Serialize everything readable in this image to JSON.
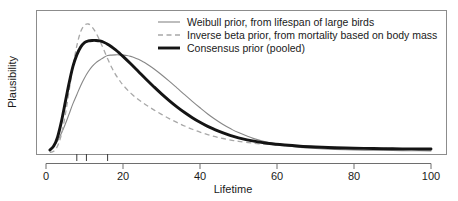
{
  "chart_data": {
    "type": "line",
    "title": "",
    "xlabel": "Lifetime",
    "ylabel": "Plausibility",
    "xlim": [
      0,
      104
    ],
    "ylim": [
      0,
      1.08
    ],
    "grid": false,
    "legend_position": "top-right-inside",
    "xticks": [
      0,
      20,
      40,
      60,
      80,
      100
    ],
    "xtick_labels": [
      "0",
      "20",
      "40",
      "60",
      "80",
      "100"
    ],
    "yticks": [],
    "ytick_labels": [],
    "rug_marks": [
      8,
      10.5,
      16
    ],
    "series": [
      {
        "name": "Weibull prior, from lifespan of large birds",
        "style": "solid-thin",
        "color": "#878787",
        "peak_x": 21,
        "peak_y": 0.76,
        "x": [
          1,
          2,
          3,
          4,
          5,
          6,
          7,
          8,
          9,
          10,
          11,
          12,
          13,
          14,
          15,
          16,
          17,
          18,
          19,
          20,
          21,
          22,
          23,
          24,
          25,
          26,
          28,
          30,
          32,
          34,
          36,
          38,
          40,
          42,
          44,
          46,
          48,
          50,
          54,
          58,
          62,
          66,
          70,
          75,
          80,
          85,
          90,
          95,
          100
        ],
        "y": [
          0.02,
          0.05,
          0.09,
          0.15,
          0.22,
          0.3,
          0.38,
          0.45,
          0.52,
          0.58,
          0.63,
          0.67,
          0.7,
          0.72,
          0.74,
          0.755,
          0.758,
          0.76,
          0.76,
          0.758,
          0.755,
          0.748,
          0.738,
          0.725,
          0.71,
          0.693,
          0.652,
          0.605,
          0.555,
          0.503,
          0.45,
          0.398,
          0.348,
          0.3,
          0.257,
          0.218,
          0.184,
          0.155,
          0.108,
          0.076,
          0.054,
          0.04,
          0.031,
          0.024,
          0.02,
          0.017,
          0.015,
          0.014,
          0.013
        ]
      },
      {
        "name": "Inverse beta prior, from mortality based on body mass",
        "style": "dashed",
        "color": "#a8a8a8",
        "peak_x": 11,
        "peak_y": 1.0,
        "x": [
          1,
          2,
          3,
          4,
          5,
          6,
          7,
          8,
          9,
          10,
          11,
          12,
          13,
          14,
          15,
          16,
          17,
          18,
          19,
          20,
          22,
          24,
          26,
          28,
          30,
          32,
          34,
          36,
          38,
          40,
          42,
          44,
          46,
          48,
          50,
          54,
          58,
          62,
          66,
          70,
          75,
          80,
          85,
          90,
          95,
          100
        ],
        "y": [
          0.0,
          0.01,
          0.05,
          0.14,
          0.29,
          0.48,
          0.67,
          0.83,
          0.94,
          0.99,
          1.0,
          0.975,
          0.93,
          0.87,
          0.8,
          0.73,
          0.665,
          0.61,
          0.565,
          0.525,
          0.462,
          0.412,
          0.37,
          0.332,
          0.297,
          0.264,
          0.234,
          0.206,
          0.181,
          0.159,
          0.14,
          0.123,
          0.109,
          0.097,
          0.087,
          0.072,
          0.062,
          0.054,
          0.048,
          0.044,
          0.039,
          0.036,
          0.033,
          0.031,
          0.03,
          0.029
        ]
      },
      {
        "name": "Consensus prior (pooled)",
        "style": "solid-thick",
        "color": "#141414",
        "peak_x": 13.5,
        "peak_y": 0.87,
        "x": [
          1,
          2,
          3,
          4,
          5,
          6,
          7,
          8,
          9,
          10,
          11,
          12,
          13,
          14,
          15,
          16,
          17,
          18,
          19,
          20,
          22,
          24,
          26,
          28,
          30,
          32,
          34,
          36,
          38,
          40,
          42,
          44,
          46,
          48,
          50,
          54,
          58,
          62,
          66,
          70,
          75,
          80,
          85,
          90,
          95,
          100
        ],
        "y": [
          0.02,
          0.05,
          0.12,
          0.24,
          0.39,
          0.54,
          0.67,
          0.76,
          0.82,
          0.855,
          0.868,
          0.872,
          0.872,
          0.868,
          0.858,
          0.843,
          0.823,
          0.8,
          0.775,
          0.748,
          0.69,
          0.63,
          0.57,
          0.512,
          0.456,
          0.404,
          0.355,
          0.311,
          0.271,
          0.235,
          0.203,
          0.176,
          0.152,
          0.131,
          0.114,
          0.088,
          0.07,
          0.058,
          0.049,
          0.043,
          0.037,
          0.033,
          0.031,
          0.029,
          0.028,
          0.027
        ]
      }
    ]
  }
}
